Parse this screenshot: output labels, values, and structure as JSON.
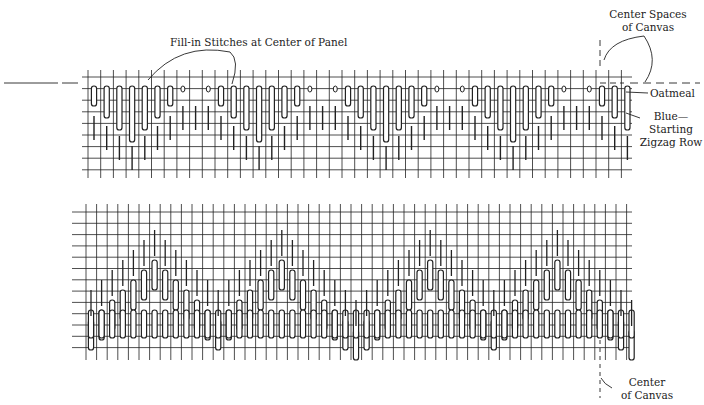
{
  "figure": {
    "top_panel": {
      "name": "Starting zigzag row diagram",
      "labels": {
        "fill_in": "Fill-in Stitches at Center of Panel",
        "center_spaces_line1": "Center Spaces",
        "center_spaces_line2": "of Canvas",
        "oatmeal": "Oatmeal",
        "blue_line1": "Blue—",
        "blue_line2": "Starting",
        "blue_line3": "Zigzag Row"
      }
    },
    "bottom_panel": {
      "name": "Completed pattern diagram",
      "labels": {
        "center_line1": "Center",
        "center_line2": "of Canvas"
      }
    },
    "colors": {
      "ink": "#222222",
      "background": "#ffffff"
    }
  }
}
